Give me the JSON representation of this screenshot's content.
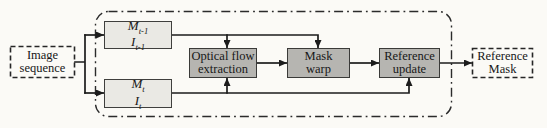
{
  "diagram": {
    "nodes": {
      "image_sequence": {
        "line1": "Image",
        "line2": "sequence"
      },
      "frame_prev": {
        "row1": {
          "base": "M",
          "sub": "t-1"
        },
        "row2": {
          "base": "I",
          "sub": "t-1"
        }
      },
      "frame_cur": {
        "row1": {
          "base": "M",
          "sub": "t"
        },
        "row2": {
          "base": "I",
          "sub": "t"
        }
      },
      "optical_flow": {
        "line1": "Optical flow",
        "line2": "extraction"
      },
      "mask_warp": {
        "line1": "Mask",
        "line2": "warp"
      },
      "reference_update": {
        "line1": "Reference",
        "line2": "update"
      },
      "reference_mask": {
        "line1": "Reference",
        "line2": "Mask"
      }
    },
    "colors": {
      "background": "#fbfaf6",
      "text": "#171717",
      "wire": "#1c1c1c",
      "frame": "#2b2b2b",
      "data_box_fill": "#eae9e4",
      "data_box_border": "#3f3f3d",
      "process_box_fill": "#b6b5b1",
      "process_box_border": "#3a3a38",
      "dashed_box_border": "#262626"
    }
  }
}
